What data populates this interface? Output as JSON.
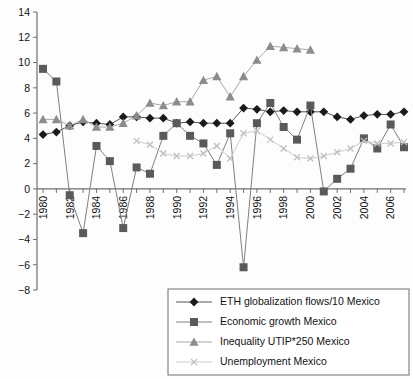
{
  "chart_data": {
    "type": "line",
    "title": "",
    "subtitle": "",
    "xlabel": "",
    "ylabel": "",
    "xlim": [
      1979.5,
      2007.5
    ],
    "ylim": [
      -8,
      14
    ],
    "grid": false,
    "legend_position": "bottom-right",
    "y_ticks": [
      14,
      12,
      10,
      8,
      6,
      4,
      2,
      0,
      "−2",
      "−4",
      "−6",
      "−8"
    ],
    "y_tick_values": [
      14,
      12,
      10,
      8,
      6,
      4,
      2,
      0,
      -2,
      -4,
      -6,
      -8
    ],
    "x_ticks_all": [
      1980,
      1981,
      1982,
      1983,
      1984,
      1985,
      1986,
      1987,
      1988,
      1989,
      1990,
      1991,
      1992,
      1993,
      1994,
      1995,
      1996,
      1997,
      1998,
      1999,
      2000,
      2001,
      2002,
      2003,
      2004,
      2005,
      2006,
      2007
    ],
    "x_tick_labels": [
      1980,
      1982,
      1984,
      1986,
      1988,
      1990,
      1992,
      1994,
      1996,
      1998,
      2000,
      2002,
      2004,
      2006
    ],
    "x": [
      1980,
      1981,
      1982,
      1983,
      1984,
      1985,
      1986,
      1987,
      1988,
      1989,
      1990,
      1991,
      1992,
      1993,
      1994,
      1995,
      1996,
      1997,
      1998,
      1999,
      2000,
      2001,
      2002,
      2003,
      2004,
      2005,
      2006,
      2007
    ],
    "series": [
      {
        "name": "ETH globalization flows/10 Mexico",
        "marker": "diamond",
        "color": "#1a1a1a",
        "line_color": "#555555",
        "values": [
          4.3,
          4.5,
          5.0,
          5.3,
          5.2,
          5.1,
          5.7,
          5.7,
          5.6,
          5.6,
          5.2,
          5.3,
          5.2,
          5.2,
          5.2,
          6.4,
          6.3,
          6.1,
          6.2,
          6.1,
          6.1,
          6.1,
          5.7,
          5.5,
          5.8,
          5.9,
          5.9,
          6.1
        ]
      },
      {
        "name": "Economic growth Mexico",
        "marker": "square",
        "color": "#5a5a5a",
        "line_color": "#808080",
        "values": [
          9.5,
          8.5,
          -0.5,
          -3.5,
          3.4,
          2.2,
          -3.1,
          1.7,
          1.2,
          4.2,
          5.2,
          4.2,
          3.6,
          1.9,
          4.4,
          -6.2,
          5.2,
          6.8,
          4.9,
          3.9,
          6.6,
          -0.2,
          0.8,
          1.6,
          4.0,
          3.2,
          5.1,
          3.3
        ]
      },
      {
        "name": "Inequality UTIP*250 Mexico",
        "marker": "triangle",
        "color": "#8c8c8c",
        "line_color": "#a8a8a8",
        "values": [
          5.5,
          5.5,
          5.0,
          5.5,
          4.9,
          4.9,
          5.2,
          5.8,
          6.8,
          6.6,
          6.9,
          6.9,
          8.6,
          8.9,
          7.3,
          8.9,
          10.2,
          11.3,
          11.2,
          11.1,
          11.0,
          null,
          null,
          null,
          null,
          null,
          null,
          null
        ]
      },
      {
        "name": "Unemployment Mexico",
        "marker": "x",
        "color": "#c0c0c0",
        "line_color": "#cccccc",
        "values": [
          null,
          null,
          null,
          null,
          null,
          null,
          null,
          3.8,
          3.5,
          2.8,
          2.6,
          2.6,
          2.8,
          3.4,
          2.4,
          4.4,
          4.6,
          3.9,
          3.2,
          2.5,
          2.4,
          2.6,
          2.9,
          3.2,
          3.8,
          3.6,
          3.6,
          3.7
        ]
      }
    ]
  },
  "legend": {
    "items": [
      {
        "label": "ETH globalization flows/10 Mexico",
        "marker": "diamond-icon"
      },
      {
        "label": "Economic growth Mexico",
        "marker": "square-icon"
      },
      {
        "label": "Inequality UTIP*250 Mexico",
        "marker": "triangle-icon"
      },
      {
        "label": "Unemployment Mexico",
        "marker": "x-icon"
      }
    ]
  }
}
